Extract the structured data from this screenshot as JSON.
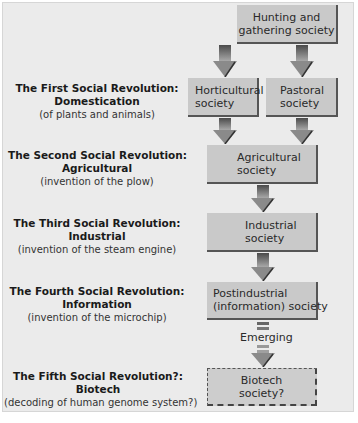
{
  "boxes": {
    "hunting": [
      "Hunting and",
      "gathering society"
    ],
    "horticultural": [
      "Horticultural",
      "society"
    ],
    "pastoral": [
      "Pastoral",
      "society"
    ],
    "agricultural": [
      "Agricultural",
      "society"
    ],
    "industrial": [
      "Industrial",
      "society"
    ],
    "postindustrial": [
      "Postindustrial",
      "(information) society"
    ],
    "biotech": [
      "Biotech",
      "society?"
    ]
  },
  "revolutions": [
    {
      "title1": "The First Social Revolution:",
      "title2": "Domestication",
      "sub": "(of plants and animals)"
    },
    {
      "title1": "The Second Social Revolution:",
      "title2": "Agricultural",
      "sub": "(invention of the plow)"
    },
    {
      "title1": "The Third Social Revolution:",
      "title2": "Industrial",
      "sub": "(invention of the steam engine)"
    },
    {
      "title1": "The Fourth Social Revolution:",
      "title2": "Information",
      "sub": "(invention of the microchip)"
    },
    {
      "title1": "The Fifth Social Revolution?:",
      "title2": "Biotech",
      "sub": "(decoding of human genome system?)"
    }
  ],
  "emerging_label": "Emerging",
  "colors": {
    "panel": "#ebebeb",
    "box": "#c9c9c9",
    "arrow_dark": "#555555",
    "arrow_light": "#9a9a9a"
  }
}
